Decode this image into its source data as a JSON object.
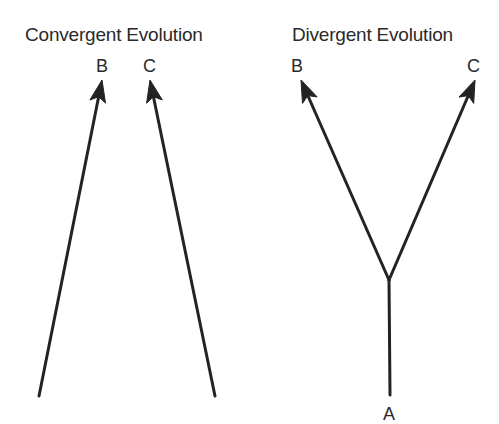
{
  "panels": [
    {
      "id": "convergent",
      "title": "Convergent Evolution",
      "labels": {
        "b": "B",
        "c": "C"
      },
      "arrows": [
        {
          "name": "arrow-to-b",
          "from": [
            39,
            396
          ],
          "to": [
            102,
            80
          ]
        },
        {
          "name": "arrow-to-c",
          "from": [
            215,
            396
          ],
          "to": [
            150,
            80
          ]
        }
      ]
    },
    {
      "id": "divergent",
      "title": "Divergent Evolution",
      "labels": {
        "a": "A",
        "b": "B",
        "c": "C"
      },
      "stem": {
        "from": [
          390,
          395
        ],
        "to": [
          389,
          280
        ]
      },
      "arrows": [
        {
          "name": "arrow-to-b",
          "from": [
            389,
            280
          ],
          "to": [
            301,
            80
          ]
        },
        {
          "name": "arrow-to-c",
          "from": [
            389,
            280
          ],
          "to": [
            475,
            80
          ]
        }
      ]
    }
  ],
  "colors": {
    "line": "#232323",
    "text": "#2a2a2a",
    "background": "#ffffff"
  }
}
